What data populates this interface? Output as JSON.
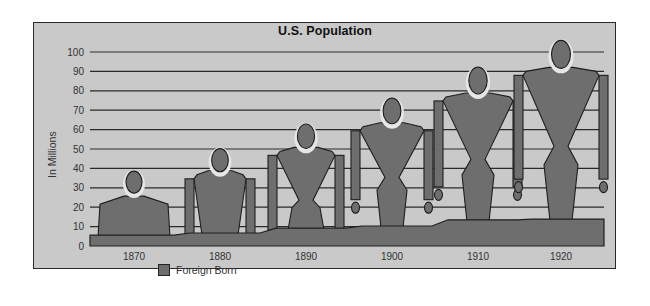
{
  "chart_data": {
    "type": "bar",
    "style": "pictograph",
    "title": "U.S. Population",
    "xlabel": "",
    "ylabel": "In Millions",
    "ylim": [
      0,
      100
    ],
    "yticks": [
      0,
      10,
      20,
      30,
      40,
      50,
      60,
      70,
      80,
      90,
      100
    ],
    "grid": true,
    "legend_position": "bottom-left",
    "categories": [
      "1870",
      "1880",
      "1890",
      "1900",
      "1910",
      "1920"
    ],
    "series": [
      {
        "name": "Total Population",
        "values": [
          38.6,
          50.2,
          62.9,
          76.2,
          92.2,
          106.0
        ],
        "representation": "human figure height"
      },
      {
        "name": "Foreign Born",
        "values": [
          5.6,
          6.7,
          9.2,
          10.3,
          13.5,
          13.9
        ],
        "representation": "shaded area"
      }
    ],
    "legend": [
      {
        "label": "Foreign Born",
        "color": "#6e6e6e"
      }
    ],
    "colors": {
      "background": "#c9c9c9",
      "figure": "#6e6e6e",
      "outline": "#1e1e1e",
      "gridline": "#2a2a2a"
    }
  }
}
